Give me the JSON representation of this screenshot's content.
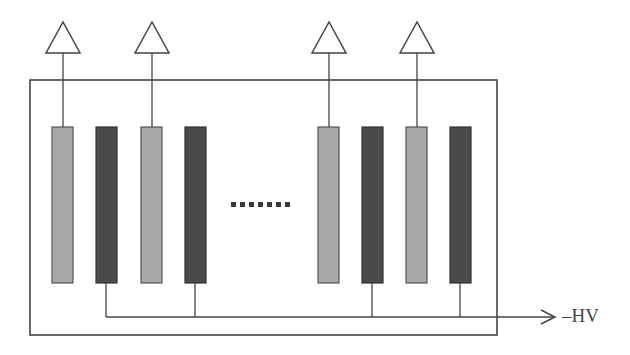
{
  "diagram": {
    "type": "detector-electrode-schematic",
    "colors": {
      "outline": "#444444",
      "readout_electrode": "#a8a8a8",
      "hv_electrode": "#4a4a4a",
      "dots": "#3a3a3a",
      "background": "#ffffff"
    },
    "enclosure": {
      "x": 30,
      "y": 80,
      "width": 467,
      "height": 255
    },
    "amplifiers": [
      {
        "cx": 63,
        "label": ""
      },
      {
        "cx": 152,
        "label": ""
      },
      {
        "cx": 329,
        "label": ""
      },
      {
        "cx": 417,
        "label": ""
      }
    ],
    "readout_electrodes": [
      {
        "x": 52
      },
      {
        "x": 141
      },
      {
        "x": 318
      },
      {
        "x": 406
      }
    ],
    "hv_electrodes": [
      {
        "x": 96
      },
      {
        "x": 185
      },
      {
        "x": 362
      },
      {
        "x": 450
      }
    ],
    "electrode_geometry": {
      "width": 21,
      "top": 127,
      "bottom": 283
    },
    "ellipsis": {
      "count": 7,
      "x_start": 231,
      "y": 205,
      "spacing": 9,
      "size": 5
    },
    "hv_bus": {
      "y": 317,
      "x_start": 106,
      "x_end": 555
    },
    "hv_label": "–HV"
  }
}
